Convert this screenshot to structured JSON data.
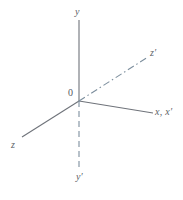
{
  "figure": {
    "width": 183,
    "height": 200,
    "background_color": "#ffffff"
  },
  "colors": {
    "solid_axis": "#6f737a",
    "dashed_axis": "#7d8f9e",
    "label_text": "#5b5f66",
    "origin_text": "#55595f"
  },
  "origin": {
    "label": "0",
    "x": 79,
    "y": 101
  },
  "axes": [
    {
      "id": "y-axis",
      "label": "y",
      "style": "solid",
      "color": "#6f737a",
      "from": [
        79,
        101
      ],
      "to": [
        79,
        20
      ],
      "label_position": [
        75,
        7
      ]
    },
    {
      "id": "z-axis",
      "label": "z",
      "style": "solid",
      "color": "#6f737a",
      "from": [
        79,
        101
      ],
      "to": [
        22,
        137
      ],
      "label_position": [
        11,
        140
      ]
    },
    {
      "id": "x-axis",
      "label": "x, x′",
      "style": "solid",
      "color": "#6f737a",
      "from": [
        79,
        101
      ],
      "to": [
        153,
        113
      ],
      "label_position": [
        155,
        107
      ]
    },
    {
      "id": "z-prime-axis",
      "label": "z′",
      "style": "dash-dot",
      "color": "#7d8f9e",
      "from": [
        79,
        101
      ],
      "to": [
        148,
        57
      ],
      "label_position": [
        150,
        48
      ]
    },
    {
      "id": "y-prime-axis",
      "label": "y′",
      "style": "dashed",
      "color": "#7d8f9e",
      "from": [
        79,
        101
      ],
      "to": [
        79,
        170
      ],
      "label_position": [
        76,
        172
      ]
    }
  ]
}
